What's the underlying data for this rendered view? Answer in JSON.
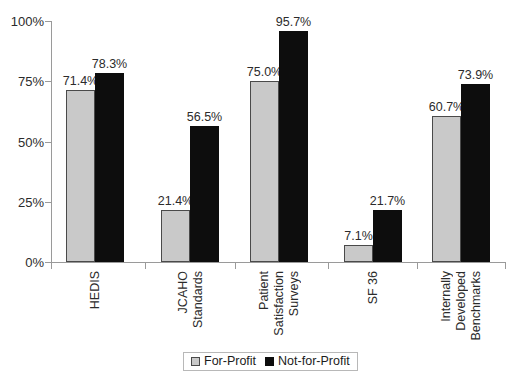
{
  "chart_data": {
    "type": "bar",
    "title": "",
    "subtitle": "",
    "xlabel": "",
    "ylabel": "",
    "ylim": [
      0,
      100
    ],
    "y_tick_labels": [
      "0%",
      "25%",
      "50%",
      "75%",
      "100%"
    ],
    "y_tick_values": [
      0,
      25,
      50,
      75,
      100
    ],
    "grid": false,
    "legend_position": "bottom",
    "categories": [
      "HEDIS",
      "JCAHO Standards",
      "Patient Satisfaction Surveys",
      "SF 36",
      "Internally Developed Benchmarks"
    ],
    "category_lines": [
      [
        "HEDIS"
      ],
      [
        "JCAHO",
        "Standards"
      ],
      [
        "Patient",
        "Satisfaction",
        "Surveys"
      ],
      [
        "SF 36"
      ],
      [
        "Internally",
        "Developed",
        "Benchmarks"
      ]
    ],
    "series": [
      {
        "name": "For-Profit",
        "color": "#c9c9c9",
        "values": [
          71.4,
          21.4,
          75.0,
          7.1,
          60.7
        ],
        "labels": [
          "71.4%",
          "21.4%",
          "75.0%",
          "7.1%",
          "60.7%"
        ]
      },
      {
        "name": "Not-for-Profit",
        "color": "#0d0d0d",
        "values": [
          78.3,
          56.5,
          95.7,
          21.7,
          73.9
        ],
        "labels": [
          "78.3%",
          "56.5%",
          "95.7%",
          "21.7%",
          "73.9%"
        ]
      }
    ]
  },
  "legend": {
    "items": [
      {
        "label": "For-Profit",
        "swatch": "gray"
      },
      {
        "label": "Not-for-Profit",
        "swatch": "black"
      }
    ]
  }
}
